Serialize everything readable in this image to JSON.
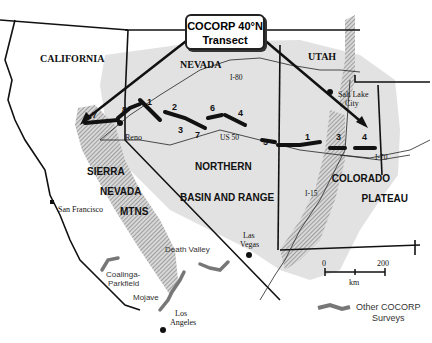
{
  "title": {
    "line1": "COCORP 40°N",
    "line2": "Transect"
  },
  "states": [
    "CALIFORNIA",
    "NEVADA",
    "UTAH"
  ],
  "regions": {
    "sierra": [
      "SIERRA",
      "NEVADA",
      "MTNS"
    ],
    "basin": [
      "NORTHERN",
      "BASIN AND RANGE"
    ],
    "plateau": [
      "COLORADO",
      "PLATEAU"
    ]
  },
  "cities": {
    "reno": "Reno",
    "slc1": "Salt Lake",
    "slc2": "City",
    "sf": "San Francisco",
    "lv1": "Las",
    "lv2": "Vegas",
    "la1": "Los",
    "la2": "Angeles"
  },
  "highways": {
    "i80": "I-80",
    "us50": "US 50",
    "i70": "I-70",
    "i15": "I-15"
  },
  "segments": [
    "7",
    "8",
    "1",
    "2",
    "3",
    "7",
    "6",
    "4",
    "5",
    "1",
    "3",
    "4"
  ],
  "other_surveys": {
    "death_valley": "Death Valley",
    "coalinga1": "Coalinga-",
    "coalinga2": "Parkfield",
    "mojave": "Mojave"
  },
  "scale": {
    "min": "0",
    "max": "200",
    "unit": "km"
  },
  "legend": {
    "line1": "Other COCORP",
    "line2": "Surveys"
  },
  "colors": {
    "basin_fill": "#e2e2e2",
    "hatch": "#888888",
    "transect": "#111111",
    "other": "#777777"
  }
}
